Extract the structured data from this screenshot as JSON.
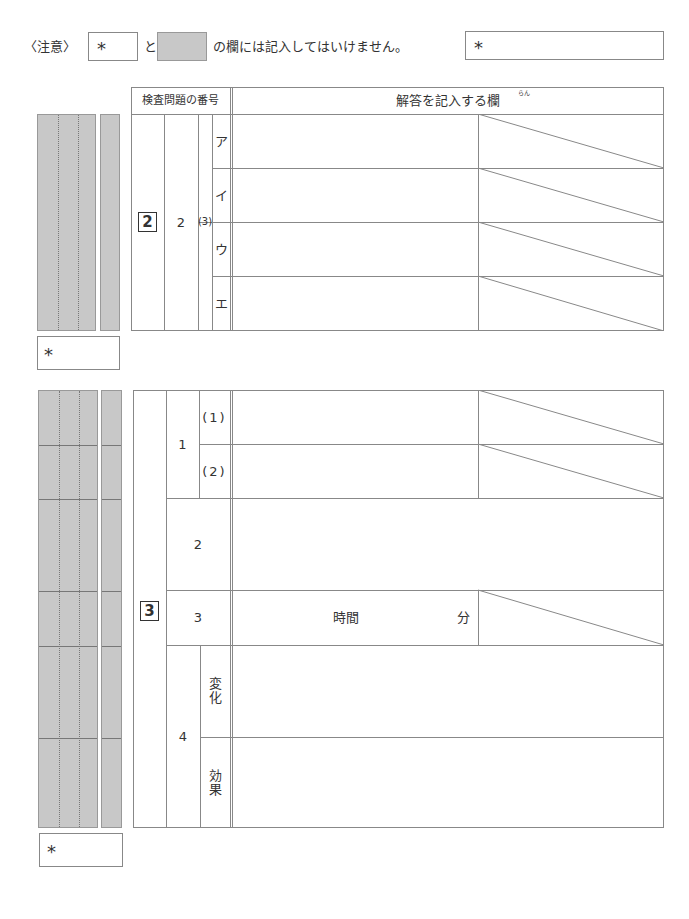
{
  "notice": {
    "label": "〈注意〉",
    "star_symbol": "*",
    "and_text": "と",
    "message": "の欄には記入してはいけません。"
  },
  "score_box_top": {
    "symbol": "*"
  },
  "header": {
    "question_number_label": "検査問題の番号",
    "answer_column_label": "解答を記入する欄",
    "ruby": "らん"
  },
  "section2": {
    "number": "2",
    "sub_number": "2",
    "part": "(3)",
    "rows": [
      {
        "label": "ア"
      },
      {
        "label": "イ"
      },
      {
        "label": "ウ"
      },
      {
        "label": "エ"
      }
    ],
    "score_box": {
      "symbol": "*"
    }
  },
  "section3": {
    "number": "3",
    "q1": {
      "label": "1",
      "parts": [
        {
          "label": "(1)"
        },
        {
          "label": "(2)"
        }
      ]
    },
    "q2": {
      "label": "2"
    },
    "q3": {
      "label": "3",
      "hours_unit": "時間",
      "minutes_unit": "分"
    },
    "q4": {
      "label": "4",
      "parts": [
        {
          "label": "変化"
        },
        {
          "label": "効果"
        }
      ]
    },
    "score_box": {
      "symbol": "*"
    }
  }
}
